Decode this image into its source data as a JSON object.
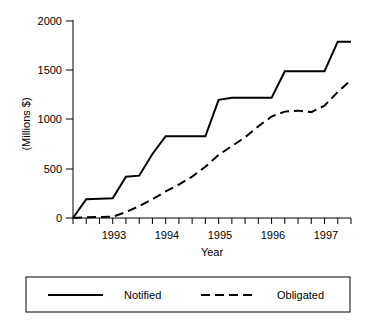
{
  "chart_data": {
    "type": "line",
    "title": "",
    "xlabel": "Year",
    "ylabel": "(Millions $)",
    "xlim": [
      1992.5,
      1997.75
    ],
    "ylim": [
      0,
      2000
    ],
    "ytick_labels": [
      "0",
      "500",
      "1000",
      "1500",
      "2000"
    ],
    "ytick_values": [
      0,
      500,
      1000,
      1500,
      2000
    ],
    "xtick_labels": [
      "1993",
      "1994",
      "1995",
      "1996",
      "1997"
    ],
    "xtick_values": [
      1993,
      1994,
      1995,
      1996,
      1997
    ],
    "minor_ticks_per_year": 4,
    "grid": false,
    "legend_position": "below-outside",
    "series": [
      {
        "name": "Notified",
        "style": "solid",
        "color": "#000000",
        "x": [
          1992.5,
          1992.75,
          1993.0,
          1993.25,
          1993.5,
          1993.75,
          1994.0,
          1994.25,
          1994.5,
          1994.75,
          1995.0,
          1995.25,
          1995.5,
          1995.75,
          1996.0,
          1996.25,
          1996.5,
          1996.75,
          1997.0,
          1997.25,
          1997.5,
          1997.75
        ],
        "values": [
          0,
          190,
          195,
          200,
          420,
          430,
          650,
          830,
          830,
          830,
          830,
          1200,
          1220,
          1220,
          1220,
          1220,
          1490,
          1490,
          1490,
          1490,
          1790,
          1790
        ]
      },
      {
        "name": "Obligated",
        "style": "dashed",
        "color": "#000000",
        "x": [
          1992.5,
          1992.75,
          1993.0,
          1993.25,
          1993.5,
          1993.75,
          1994.0,
          1994.25,
          1994.5,
          1994.75,
          1995.0,
          1995.25,
          1995.5,
          1995.75,
          1996.0,
          1996.25,
          1996.5,
          1996.75,
          1997.0,
          1997.25,
          1997.5,
          1997.75
        ],
        "values": [
          0,
          8,
          10,
          12,
          60,
          120,
          190,
          270,
          340,
          420,
          520,
          640,
          730,
          820,
          930,
          1030,
          1080,
          1090,
          1075,
          1140,
          1280,
          1400
        ]
      }
    ]
  },
  "legend": {
    "entries": [
      {
        "label": "Notified",
        "style": "solid"
      },
      {
        "label": "Obligated",
        "style": "dashed"
      }
    ]
  }
}
